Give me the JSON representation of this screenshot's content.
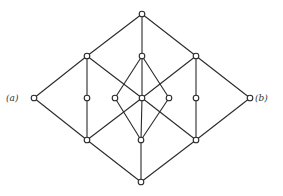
{
  "diagram": {
    "type": "lattice-hasse-diagram",
    "colors": {
      "line": "#2a2a2a",
      "node_fill": "#ffffff",
      "background": "#ffffff"
    },
    "labels": [
      {
        "id": "a",
        "text": "(a)",
        "x": 6,
        "y": 101
      },
      {
        "id": "b",
        "text": "(b)",
        "x": 255,
        "y": 101
      }
    ],
    "nodes": [
      {
        "id": "top",
        "x": 142,
        "y": 14
      },
      {
        "id": "u1",
        "x": 87,
        "y": 56
      },
      {
        "id": "u2",
        "x": 142,
        "y": 56
      },
      {
        "id": "u3",
        "x": 196,
        "y": 56
      },
      {
        "id": "a",
        "x": 34,
        "y": 98
      },
      {
        "id": "m1",
        "x": 87,
        "y": 98
      },
      {
        "id": "m2",
        "x": 115,
        "y": 98
      },
      {
        "id": "c",
        "x": 142,
        "y": 98
      },
      {
        "id": "m3",
        "x": 169,
        "y": 98
      },
      {
        "id": "m4",
        "x": 196,
        "y": 98
      },
      {
        "id": "b",
        "x": 250,
        "y": 98
      },
      {
        "id": "l1",
        "x": 87,
        "y": 140
      },
      {
        "id": "l2",
        "x": 141,
        "y": 140
      },
      {
        "id": "l3",
        "x": 196,
        "y": 140
      },
      {
        "id": "bottom",
        "x": 141,
        "y": 182
      }
    ],
    "edges": [
      [
        "top",
        "u1"
      ],
      [
        "top",
        "u2"
      ],
      [
        "top",
        "u3"
      ],
      [
        "u1",
        "a"
      ],
      [
        "u1",
        "m1"
      ],
      [
        "u1",
        "c"
      ],
      [
        "u2",
        "m2"
      ],
      [
        "u2",
        "c"
      ],
      [
        "u2",
        "m3"
      ],
      [
        "u3",
        "b"
      ],
      [
        "u3",
        "m4"
      ],
      [
        "u3",
        "c"
      ],
      [
        "a",
        "l1"
      ],
      [
        "m1",
        "l1"
      ],
      [
        "c",
        "l1"
      ],
      [
        "m2",
        "l2"
      ],
      [
        "c",
        "l2"
      ],
      [
        "m3",
        "l2"
      ],
      [
        "c",
        "l3"
      ],
      [
        "m4",
        "l3"
      ],
      [
        "b",
        "l3"
      ],
      [
        "l1",
        "bottom"
      ],
      [
        "l2",
        "bottom"
      ],
      [
        "l3",
        "bottom"
      ]
    ]
  }
}
